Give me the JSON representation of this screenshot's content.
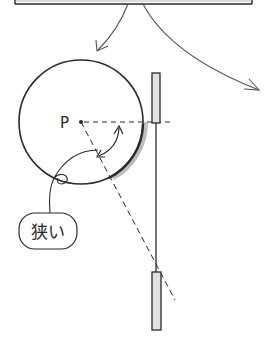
{
  "diagram": {
    "point_label": "P",
    "callout_label": "狭い",
    "colors": {
      "stroke": "#2a2a2a",
      "arrow": "#555555",
      "shade": "#b0b0b0",
      "plate_fill": "#e8e8e8"
    }
  }
}
